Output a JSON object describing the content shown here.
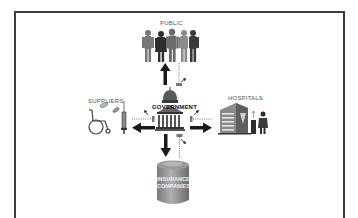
{
  "diagram": {
    "center": {
      "label": "GOVERNMENT",
      "icon": "capitol-building-icon"
    },
    "nodes": [
      {
        "id": "public",
        "label": "PUBLIC",
        "icon": "people-group-icon",
        "position": "top"
      },
      {
        "id": "suppliers",
        "label": "SUPPLIERS",
        "icon": "medical-supplies-icon",
        "position": "left"
      },
      {
        "id": "hospitals",
        "label": "HOSPITALS",
        "icon": "hospital-building-icon",
        "position": "right"
      },
      {
        "id": "insurance",
        "label": "INSURANCE COMPANIES",
        "label_lines": [
          "INSURANCE",
          "COMPANIES"
        ],
        "icon": "cylinder-tank-icon",
        "position": "bottom"
      }
    ],
    "edges": [
      {
        "from": "government",
        "to": "public",
        "type": "solid-arrow"
      },
      {
        "from": "government",
        "to": "suppliers",
        "type": "solid-arrow"
      },
      {
        "from": "government",
        "to": "hospitals",
        "type": "solid-arrow"
      },
      {
        "from": "government",
        "to": "insurance",
        "type": "solid-arrow"
      },
      {
        "from": "government",
        "to": "public",
        "type": "dotted-money-flow"
      },
      {
        "from": "government",
        "to": "suppliers",
        "type": "dotted-money-flow"
      },
      {
        "from": "government",
        "to": "hospitals",
        "type": "dotted-money-flow"
      },
      {
        "from": "government",
        "to": "insurance",
        "type": "dotted-money-flow"
      }
    ],
    "colors": {
      "frame": "#3c3c3c",
      "icon_dark": "#2e2e2e",
      "icon_mid": "#6b6b6b",
      "icon_light": "#a0a0a0",
      "arrow": "#1a1a1a",
      "background": "#ffffff"
    }
  }
}
